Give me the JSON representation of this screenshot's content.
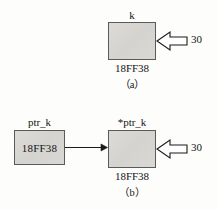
{
  "figure": {
    "background_color": "#fdfdfc",
    "box_fill_color": "#d7d6d3",
    "box_border_color": "#5a5a5a",
    "ink_color": "#141414"
  },
  "panel_a": {
    "tag": "（a）",
    "variable_label": "k",
    "address_label": "18FF38",
    "assigned_value": "30",
    "box": {
      "x": 108,
      "y": 22,
      "width": 48,
      "height": 38
    },
    "arrow": {
      "direction": "left",
      "style": "hollow-block"
    }
  },
  "panel_b": {
    "tag": "（b）",
    "pointer_label": "ptr_k",
    "pointer_value": "18FF38",
    "target_label": "*ptr_k",
    "target_address": "18FF38",
    "assigned_value": "30",
    "pointer_box": {
      "x": 14,
      "y": 130,
      "width": 51,
      "height": 35
    },
    "target_box": {
      "x": 108,
      "y": 130,
      "width": 48,
      "height": 38
    },
    "link_arrow": {
      "direction": "right",
      "style": "thin-line-solid-head"
    },
    "value_arrow": {
      "direction": "left",
      "style": "hollow-block"
    }
  }
}
